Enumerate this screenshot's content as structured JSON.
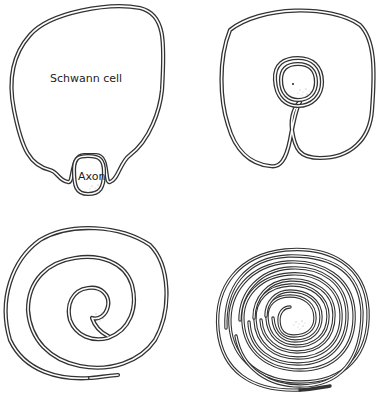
{
  "labels": {
    "schwann_cell": "Schwann cell",
    "axon": "Axon"
  },
  "panels": [
    {
      "id": "stage-1",
      "description": "Axon indenting the Schwann cell surface"
    },
    {
      "id": "stage-2",
      "description": "Axon engulfed; mesaxon formed"
    },
    {
      "id": "stage-3",
      "description": "Schwann cell membrane begins to spiral around axon"
    },
    {
      "id": "stage-4",
      "description": "Many tightly wrapped layers forming myelin sheath"
    }
  ],
  "colors": {
    "line": "#333333",
    "background": "#ffffff"
  }
}
